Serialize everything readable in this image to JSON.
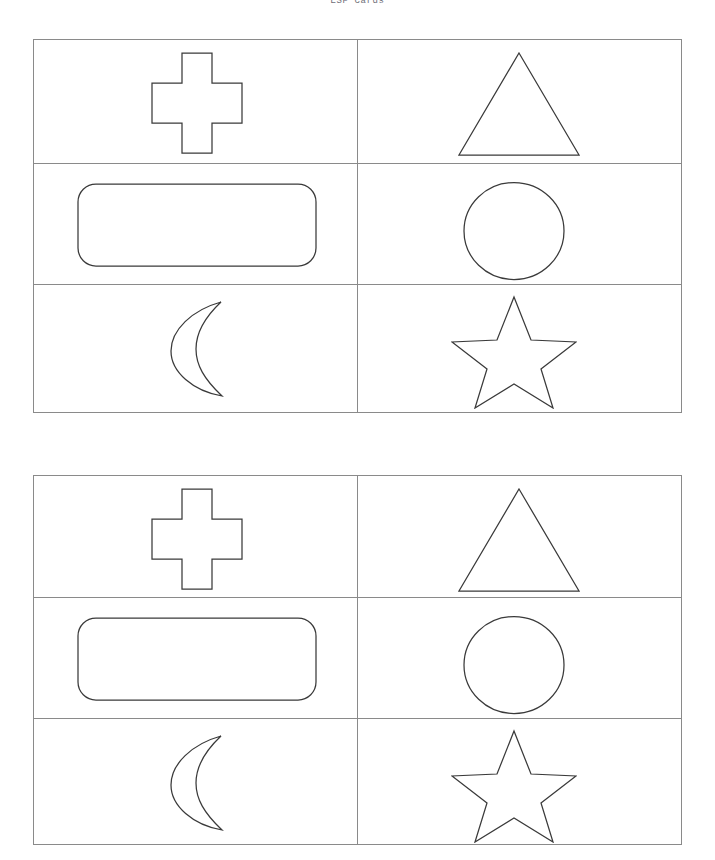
{
  "document": {
    "title": "ESP Cards"
  },
  "sheets": [
    {
      "name": "esp-card-sheet-1",
      "rows": [
        {
          "cells": [
            {
              "shape": "cross",
              "label": "Cross"
            },
            {
              "shape": "triangle",
              "label": "Triangle"
            }
          ]
        },
        {
          "cells": [
            {
              "shape": "rounded-rectangle",
              "label": "Rounded Rectangle"
            },
            {
              "shape": "circle",
              "label": "Circle"
            }
          ]
        },
        {
          "cells": [
            {
              "shape": "crescent-moon",
              "label": "Crescent Moon"
            },
            {
              "shape": "star",
              "label": "Star"
            }
          ]
        }
      ]
    },
    {
      "name": "esp-card-sheet-2",
      "rows": [
        {
          "cells": [
            {
              "shape": "cross",
              "label": "Cross"
            },
            {
              "shape": "triangle",
              "label": "Triangle"
            }
          ]
        },
        {
          "cells": [
            {
              "shape": "rounded-rectangle",
              "label": "Rounded Rectangle"
            },
            {
              "shape": "circle",
              "label": "Circle"
            }
          ]
        },
        {
          "cells": [
            {
              "shape": "crescent-moon",
              "label": "Crescent Moon"
            },
            {
              "shape": "star",
              "label": "Star"
            }
          ]
        }
      ]
    }
  ],
  "style": {
    "page_background": "#ffffff",
    "border_color": "#8a8a8a",
    "shape_stroke_color": "#3a3a3a",
    "shape_fill_color": "#ffffff",
    "title_color": "#6e6e78"
  }
}
